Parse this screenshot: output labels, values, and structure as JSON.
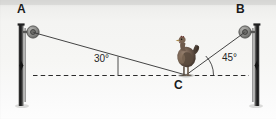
{
  "figure": {
    "type": "geometry-diagram",
    "background_color": "#f4f4f2",
    "ink_color": "#1b1b1b",
    "post_color": "#3a3a3a"
  },
  "labels": {
    "point_a": "A",
    "point_b": "B",
    "point_c": "C"
  },
  "angles": {
    "left": "30°",
    "right": "45°",
    "left_value": 30,
    "right_value": 45
  },
  "icons": {
    "hen": "hen-icon",
    "ring_left": "pulley-ring-icon",
    "ring_right": "pulley-ring-icon",
    "post_left": "post-icon",
    "post_right": "post-icon"
  },
  "geometry": {
    "point_a": [
      33,
      32
    ],
    "point_b": [
      245,
      32
    ],
    "point_c": [
      186,
      75
    ],
    "ground_line_y": 75,
    "ground_line_x1": 33,
    "ground_line_x2": 249,
    "post_left_x": 20,
    "post_right_x": 258,
    "post_top_y": 24,
    "post_bottom_y": 106
  }
}
